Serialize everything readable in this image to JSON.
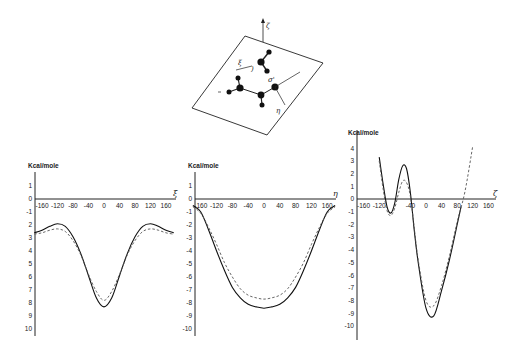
{
  "figure": {
    "diagram": {
      "labels": {
        "zeta": "ζ",
        "xi": "ξ",
        "sigma": "σ'",
        "eta": "η"
      }
    }
  },
  "chart_data": [
    {
      "type": "line",
      "title": "",
      "ylabel": "Kcal/mole",
      "xlabel": "ξ",
      "x_ticks": [
        "-160",
        "-120",
        "-80",
        "-40",
        "0",
        "40",
        "80",
        "120",
        "160"
      ],
      "y_ticks": [
        "1",
        "0",
        "-1",
        "2",
        "3",
        "4",
        "5",
        "6",
        "7",
        "8",
        "9",
        "10"
      ],
      "xlim": [
        -180,
        180
      ],
      "ylim": [
        -10,
        1
      ],
      "x": [
        -180,
        -160,
        -140,
        -120,
        -100,
        -80,
        -60,
        -40,
        -20,
        0,
        20,
        40,
        60,
        80,
        100,
        120,
        140,
        160,
        180
      ],
      "series": [
        {
          "name": "solid",
          "style": "solid",
          "values": [
            -2.6,
            -2.4,
            -2.1,
            -1.9,
            -2.1,
            -2.9,
            -4.2,
            -5.9,
            -7.6,
            -8.3,
            -7.6,
            -5.9,
            -4.2,
            -2.9,
            -2.1,
            -1.9,
            -2.1,
            -2.4,
            -2.6
          ]
        },
        {
          "name": "dashed",
          "style": "dashed",
          "values": [
            -2.7,
            -2.6,
            -2.4,
            -2.3,
            -2.5,
            -3.2,
            -4.3,
            -5.8,
            -7.1,
            -7.8,
            -7.1,
            -5.8,
            -4.3,
            -3.2,
            -2.5,
            -2.3,
            -2.4,
            -2.6,
            -2.7
          ]
        }
      ],
      "grid": false,
      "legend": null
    },
    {
      "type": "line",
      "title": "",
      "ylabel": "Kcal/mole",
      "xlabel": "η",
      "x_ticks": [
        "-160",
        "-120",
        "-80",
        "-40",
        "0",
        "40",
        "80",
        "120",
        "160"
      ],
      "y_ticks": [
        "1",
        "0",
        "-1",
        "-2",
        "-3",
        "-4",
        "-5",
        "-6",
        "-7",
        "-8",
        "-9",
        "-10"
      ],
      "xlim": [
        -180,
        180
      ],
      "ylim": [
        -10,
        1
      ],
      "x": [
        -180,
        -160,
        -140,
        -120,
        -100,
        -80,
        -60,
        -40,
        -20,
        0,
        20,
        40,
        60,
        80,
        100,
        120,
        140,
        160,
        180
      ],
      "series": [
        {
          "name": "solid",
          "style": "solid",
          "values": [
            -0.5,
            -1.0,
            -2.4,
            -4.0,
            -5.5,
            -6.8,
            -7.6,
            -8.1,
            -8.3,
            -8.4,
            -8.3,
            -8.1,
            -7.6,
            -6.8,
            -5.5,
            -4.0,
            -2.4,
            -1.0,
            -0.5
          ]
        },
        {
          "name": "dashed",
          "style": "dashed",
          "values": [
            -0.6,
            -1.1,
            -2.2,
            -3.5,
            -4.9,
            -6.0,
            -6.9,
            -7.4,
            -7.6,
            -7.7,
            -7.6,
            -7.4,
            -6.9,
            -6.0,
            -4.9,
            -3.5,
            -2.2,
            -1.1,
            -0.6
          ]
        }
      ],
      "grid": false,
      "legend": null
    },
    {
      "type": "line",
      "title": "",
      "ylabel": "Kcal/mole",
      "xlabel": "ζ",
      "x_ticks": [
        "-160",
        "-120",
        "-40",
        "0",
        "40",
        "80",
        "120",
        "160"
      ],
      "y_ticks": [
        "4",
        "3",
        "2",
        "1",
        "0",
        "-1",
        "-2",
        "-3",
        "-4",
        "-5",
        "-6",
        "-7",
        "-8",
        "-9",
        "-10"
      ],
      "xlim": [
        -180,
        180
      ],
      "ylim": [
        -10,
        4
      ],
      "series": [
        {
          "name": "solid",
          "style": "solid",
          "x": [
            -120,
            -110,
            -100,
            -90,
            -80,
            -70,
            -60,
            -50,
            -40,
            -30,
            -20,
            0,
            20,
            40,
            60,
            80,
            90
          ],
          "values": [
            3.3,
            1.2,
            -0.6,
            -1.1,
            -0.3,
            1.5,
            2.6,
            2.4,
            0.5,
            -2.5,
            -5.0,
            -8.6,
            -9.2,
            -7.2,
            -4.8,
            -2.0,
            -0.6
          ]
        },
        {
          "name": "dashed",
          "style": "dashed",
          "x": [
            -120,
            -110,
            -100,
            -90,
            -80,
            -70,
            -60,
            -50,
            -40,
            -30,
            -20,
            0,
            20,
            40,
            60,
            80,
            100,
            120
          ],
          "values": [
            3.0,
            0.8,
            -0.9,
            -1.3,
            -0.7,
            0.5,
            1.4,
            1.3,
            0.2,
            -2.3,
            -4.8,
            -8.0,
            -8.4,
            -6.8,
            -4.5,
            -1.8,
            0.6,
            4.2
          ]
        }
      ],
      "grid": false,
      "legend": null
    }
  ]
}
